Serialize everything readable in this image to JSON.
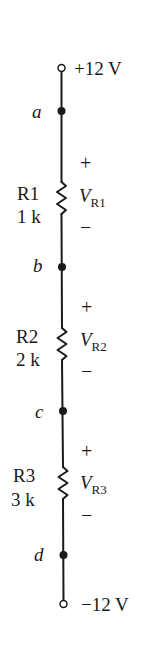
{
  "diagram": {
    "type": "series resistor voltage divider",
    "supply_top": {
      "label": "+12 V"
    },
    "supply_bottom": {
      "label": "−12 V"
    },
    "nodes": [
      {
        "id": "a",
        "label": "a"
      },
      {
        "id": "b",
        "label": "b"
      },
      {
        "id": "c",
        "label": "c"
      },
      {
        "id": "d",
        "label": "d"
      }
    ],
    "resistors": [
      {
        "name": "R1",
        "value": "1 k",
        "voltage_symbol": "V",
        "voltage_sub": "R1",
        "plus": "+",
        "minus": "−"
      },
      {
        "name": "R2",
        "value": "2 k",
        "voltage_symbol": "V",
        "voltage_sub": "R2",
        "plus": "+",
        "minus": "−"
      },
      {
        "name": "R3",
        "value": "3 k",
        "voltage_symbol": "V",
        "voltage_sub": "R3",
        "plus": "+",
        "minus": "−"
      }
    ],
    "colors": {
      "ink": "#1a1a1a",
      "background": "#ffffff"
    }
  }
}
